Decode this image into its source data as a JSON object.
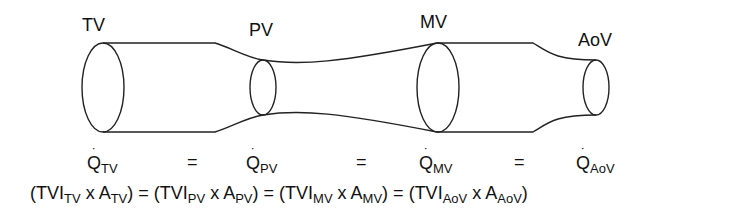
{
  "valves": [
    {
      "id": "TV",
      "label": "TV"
    },
    {
      "id": "PV",
      "label": "PV"
    },
    {
      "id": "MV",
      "label": "MV"
    },
    {
      "id": "AoV",
      "label": "AoV"
    }
  ],
  "flow_equation": {
    "symbol": "Q",
    "dot": "˙",
    "equals": "=",
    "terms": [
      {
        "sub": "TV"
      },
      {
        "sub": "PV"
      },
      {
        "sub": "MV"
      },
      {
        "sub": "AoV"
      }
    ]
  },
  "product_equation": {
    "open": "(",
    "tvi": "TVI",
    "times": " x ",
    "area": "A",
    "close": ")",
    "equals": " = ",
    "terms": [
      {
        "sub": "TV"
      },
      {
        "sub": "PV"
      },
      {
        "sub": "MV"
      },
      {
        "sub": "AoV"
      }
    ]
  }
}
